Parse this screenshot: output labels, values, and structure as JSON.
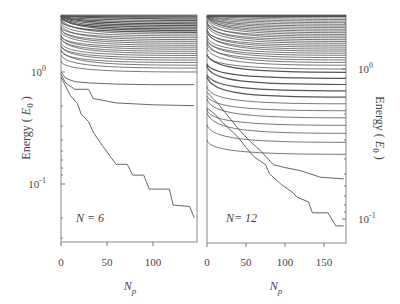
{
  "chart_data": [
    {
      "type": "line",
      "panel": "left",
      "annotation": "N = 6",
      "xlabel": "N_p",
      "ylabel": "Energy ( E_0 )",
      "yscale": "log",
      "xlim": [
        0,
        148
      ],
      "ylim": [
        0.033,
        3.4
      ],
      "xticks": [
        0,
        50,
        100
      ],
      "yticks": [
        "10^0",
        "10^-1"
      ],
      "grid": false,
      "series": [
        {
          "name": "level-1",
          "x": [
            0,
            5,
            10,
            18,
            22,
            30,
            35,
            45,
            55,
            60,
            72,
            78,
            90,
            96,
            118,
            122,
            140,
            145
          ],
          "values": [
            0.9,
            0.75,
            0.62,
            0.52,
            0.42,
            0.36,
            0.29,
            0.22,
            0.17,
            0.15,
            0.15,
            0.12,
            0.12,
            0.09,
            0.09,
            0.065,
            0.063,
            0.05
          ]
        },
        {
          "name": "level-2",
          "x": [
            0,
            5,
            15,
            30,
            35,
            60,
            100,
            145
          ],
          "values": [
            0.95,
            0.8,
            0.7,
            0.7,
            0.58,
            0.53,
            0.51,
            0.5
          ]
        },
        {
          "name": "level-3",
          "x": [
            0,
            5,
            15,
            30,
            60,
            100,
            145
          ],
          "values": [
            1.0,
            0.88,
            0.82,
            0.8,
            0.78,
            0.77,
            0.77
          ]
        },
        {
          "name": "levels-upper",
          "count": 30,
          "range": [
            1.0,
            3.3
          ]
        }
      ]
    },
    {
      "type": "line",
      "panel": "right",
      "annotation": "N = 12",
      "xlabel": "N_p",
      "ylabel": "Energy ( E_0 )",
      "yscale": "log",
      "xlim": [
        0,
        178
      ],
      "ylim": [
        0.075,
        3.4
      ],
      "xticks": [
        0,
        50,
        100,
        150
      ],
      "yticks": [
        "10^0",
        "10^-1"
      ],
      "grid": false,
      "series": [
        {
          "name": "level-1",
          "x": [
            0,
            10,
            20,
            40,
            50,
            60,
            75,
            80,
            95,
            110,
            115,
            130,
            135,
            155,
            165,
            175
          ],
          "values": [
            0.55,
            0.5,
            0.44,
            0.35,
            0.3,
            0.26,
            0.23,
            0.2,
            0.17,
            0.15,
            0.14,
            0.13,
            0.11,
            0.11,
            0.09,
            0.09
          ]
        },
        {
          "name": "level-2",
          "x": [
            0,
            15,
            25,
            40,
            55,
            70,
            85,
            100,
            120,
            145,
            175
          ],
          "values": [
            0.7,
            0.58,
            0.5,
            0.4,
            0.33,
            0.28,
            0.23,
            0.22,
            0.21,
            0.19,
            0.185
          ]
        },
        {
          "name": "levels-mid",
          "count": 12,
          "range": [
            0.27,
            0.95
          ]
        },
        {
          "name": "levels-upper",
          "count": 45,
          "range": [
            1.0,
            3.3
          ]
        }
      ]
    }
  ],
  "panels": {
    "left": {
      "annotation": "N = 6",
      "xticks": [
        "0",
        "50",
        "100"
      ],
      "ytick_top": "10",
      "ytick_top_exp": "0",
      "ytick_bottom": "10",
      "ytick_bottom_exp": "-1"
    },
    "right": {
      "annotation": "N= 12",
      "xticks": [
        "0",
        "50",
        "100",
        "150"
      ],
      "ytick_top": "10",
      "ytick_top_exp": "0",
      "ytick_bottom": "10",
      "ytick_bottom_exp": "-1"
    }
  },
  "labels": {
    "xlabel_main": "N",
    "xlabel_sub": "p",
    "ylabel_prefix": "Energy ( ",
    "ylabel_E": "E",
    "ylabel_sub": "0",
    "ylabel_suffix": " )"
  },
  "colors": {
    "line": "#555555",
    "frame": "#777777",
    "text": "#444444"
  }
}
